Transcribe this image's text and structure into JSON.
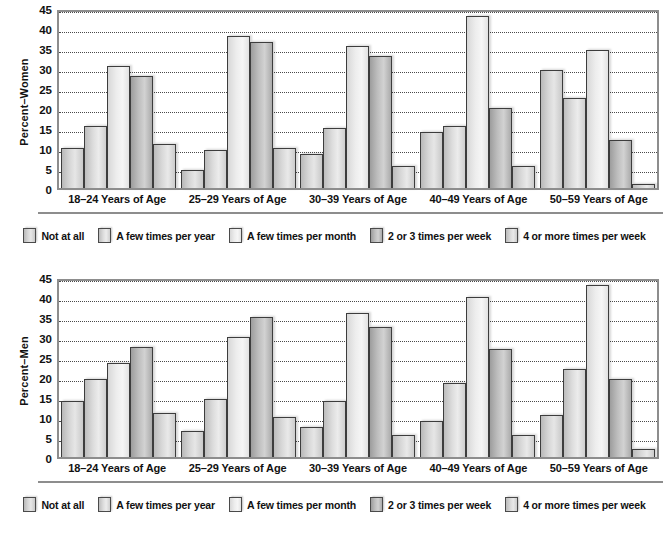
{
  "chart_data": [
    {
      "type": "bar",
      "title": "",
      "xlabel": "",
      "ylabel": "Percent–Women",
      "ylim": [
        0,
        45
      ],
      "yticks": [
        45,
        40,
        35,
        30,
        25,
        20,
        15,
        10,
        5,
        0
      ],
      "grid": true,
      "legend_position": "bottom",
      "categories": [
        "18–24 Years of Age",
        "25–29 Years of Age",
        "30–39 Years of Age",
        "40–49 Years of Age",
        "50–59 Years of Age"
      ],
      "series": [
        {
          "name": "Not at all",
          "values": [
            10.5,
            5.0,
            9.0,
            14.5,
            30.0
          ]
        },
        {
          "name": "A few times per year",
          "values": [
            16.0,
            10.0,
            15.5,
            16.0,
            23.0
          ]
        },
        {
          "name": "A few times per month",
          "values": [
            31.0,
            38.5,
            36.0,
            43.5,
            35.0
          ]
        },
        {
          "name": "2 or 3 times per week",
          "values": [
            28.5,
            37.0,
            33.5,
            20.5,
            12.5
          ]
        },
        {
          "name": "4 or more times per week",
          "values": [
            11.5,
            10.5,
            6.0,
            6.0,
            1.5
          ]
        }
      ]
    },
    {
      "type": "bar",
      "title": "",
      "xlabel": "",
      "ylabel": "Percent–Men",
      "ylim": [
        0,
        45
      ],
      "yticks": [
        45,
        40,
        35,
        30,
        25,
        20,
        15,
        10,
        5,
        0
      ],
      "grid": true,
      "legend_position": "bottom",
      "categories": [
        "18–24 Years of Age",
        "25–29 Years of Age",
        "30–39 Years of Age",
        "40–49 Years of Age",
        "50–59 Years of Age"
      ],
      "series": [
        {
          "name": "Not at all",
          "values": [
            14.5,
            7.0,
            8.0,
            9.5,
            11.0
          ]
        },
        {
          "name": "A few times per year",
          "values": [
            20.0,
            15.0,
            14.5,
            19.0,
            22.5
          ]
        },
        {
          "name": "A few times per month",
          "values": [
            24.0,
            30.5,
            36.5,
            40.5,
            43.5
          ]
        },
        {
          "name": "2 or 3 times per week",
          "values": [
            28.0,
            35.5,
            33.0,
            27.5,
            20.0
          ]
        },
        {
          "name": "4 or more times per week",
          "values": [
            11.5,
            10.5,
            6.0,
            6.0,
            2.5
          ]
        }
      ]
    }
  ],
  "panels": [
    {
      "id": "women",
      "ylabel": "Percent–Women",
      "yticks": [
        "45",
        "40",
        "35",
        "30",
        "25",
        "20",
        "15",
        "10",
        "5",
        "0"
      ],
      "categories": [
        "18–24 Years of Age",
        "25–29 Years of Age",
        "30–39 Years of Age",
        "40–49 Years of Age",
        "50–59 Years of Age"
      ],
      "legend": [
        "Not at all",
        "A few times per year",
        "A few times per month",
        "2 or 3 times per week",
        "4 or more times per week"
      ]
    },
    {
      "id": "men",
      "ylabel": "Percent–Men",
      "yticks": [
        "45",
        "40",
        "35",
        "30",
        "25",
        "20",
        "15",
        "10",
        "5",
        "0"
      ],
      "categories": [
        "18–24 Years of Age",
        "25–29 Years of Age",
        "30–39 Years of Age",
        "40–49 Years of Age",
        "50–59 Years of Age"
      ],
      "legend": [
        "Not at all",
        "A few times per year",
        "A few times per month",
        "2 or 3 times per week",
        "4 or more times per week"
      ]
    }
  ],
  "colors": {
    "axis": "#8d8d8d",
    "gridline": "#4a4a4a",
    "bar_outline": "#3d3d3d",
    "text": "#111111",
    "background": "#ffffff"
  }
}
